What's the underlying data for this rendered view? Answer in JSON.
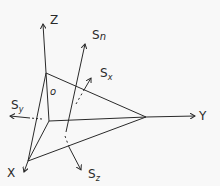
{
  "diagram": {
    "type": "tetrahedron stress diagram",
    "axes": {
      "z": "Z",
      "y": "Y",
      "x": "X"
    },
    "origin_label": "o",
    "vectors": {
      "sn": {
        "base": "S",
        "sub": "n"
      },
      "sx": {
        "base": "S",
        "sub": "x"
      },
      "sy": {
        "base": "S",
        "sub": "y"
      },
      "sz": {
        "base": "S",
        "sub": "z"
      }
    },
    "line_color": "#2a2a2a",
    "background": "#f8f8f8"
  }
}
